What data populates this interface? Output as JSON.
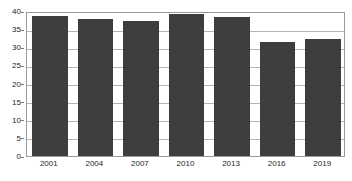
{
  "chart_data": {
    "type": "bar",
    "title": "",
    "subtitle": "",
    "xlabel": "",
    "ylabel": "",
    "categories": [
      "2001",
      "2004",
      "2007",
      "2010",
      "2013",
      "2016",
      "2019"
    ],
    "values": [
      38.5,
      37.8,
      37.2,
      39.2,
      38.4,
      31.5,
      32.2
    ],
    "series": [
      {
        "name": "",
        "values": [
          38.5,
          37.8,
          37.2,
          39.2,
          38.4,
          31.5,
          32.2
        ]
      }
    ],
    "ylim": [
      0,
      40
    ],
    "xlim_categories": 7,
    "y_ticks": [
      0,
      5,
      10,
      15,
      20,
      25,
      30,
      35,
      40
    ],
    "y_tick_labels": [
      "0",
      "5",
      "10",
      "15",
      "20",
      "25",
      "30",
      "35",
      "40"
    ],
    "x_tick_labels": [
      "2001",
      "2004",
      "2007",
      "2010",
      "2013",
      "2016",
      "2019"
    ],
    "grid": true,
    "grid_axis": "y",
    "legend": false,
    "legend_position": "none",
    "bar_color": "#3e3e3e",
    "plot_background": "#ffffff",
    "gridline_color": "#b4b4b4",
    "axis_color": "#9a9a9a",
    "tick_label_color": "#262626"
  }
}
